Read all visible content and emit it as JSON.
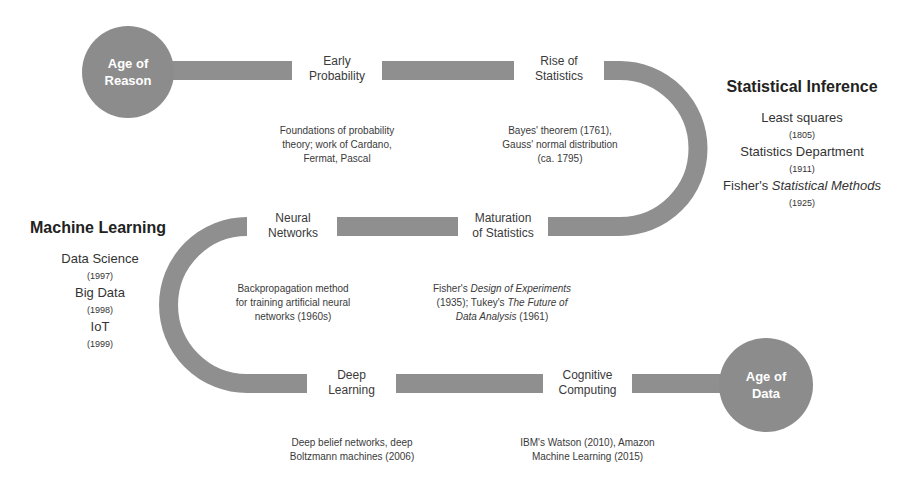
{
  "colors": {
    "track": "#8f8f8f",
    "circle": "#8c8c8c",
    "circle_text": "#ffffff"
  },
  "start": {
    "line1": "Age of",
    "line2": "Reason"
  },
  "end": {
    "line1": "Age of",
    "line2": "Data"
  },
  "nodes": [
    {
      "line1": "Early",
      "line2": "Probability",
      "desc": [
        "Foundations of probability",
        "theory; work of Cardano,",
        "Fermat, Pascal"
      ]
    },
    {
      "line1": "Rise of",
      "line2": "Statistics",
      "desc": [
        "Bayes' theorem (1761),",
        "Gauss' normal distribution",
        "(ca. 1795)"
      ]
    },
    {
      "line1": "Maturation",
      "line2": "of Statistics",
      "desc": {
        "l1_pre": "Fisher's ",
        "l1_em": "Design of Experiments",
        "l2_pre": "(1935); Tukey's ",
        "l2_em": "The Future of",
        "l3_em": "Data Analysis",
        "l3_post": " (1961)"
      }
    },
    {
      "line1": "Neural",
      "line2": "Networks",
      "desc": [
        "Backpropagation method",
        "for training artificial neural",
        "networks (1960s)"
      ]
    },
    {
      "line1": "Deep",
      "line2": "Learning",
      "desc": [
        "Deep belief networks, deep",
        "Boltzmann machines (2006)"
      ]
    },
    {
      "line1": "Cognitive",
      "line2": "Computing",
      "desc": [
        "IBM's Watson (2010), Amazon",
        "Machine Learning (2015)"
      ]
    }
  ],
  "eras": {
    "statistical_inference": {
      "title": "Statistical Inference",
      "items": [
        {
          "label": "Least squares",
          "year": "(1805)"
        },
        {
          "label": "Statistics Department",
          "year": "(1911)"
        },
        {
          "label_pre": "Fisher's ",
          "label_em": "Statistical Methods",
          "year": "(1925)"
        }
      ]
    },
    "machine_learning": {
      "title": "Machine Learning",
      "items": [
        {
          "label": "Data Science",
          "year": "(1997)"
        },
        {
          "label": "Big Data",
          "year": "(1998)"
        },
        {
          "label": "IoT",
          "year": "(1999)"
        }
      ]
    }
  }
}
